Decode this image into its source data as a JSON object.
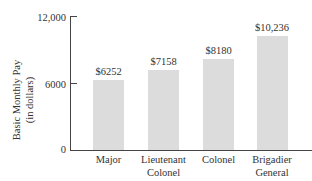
{
  "chart_data": {
    "type": "bar",
    "title": "",
    "xlabel": "",
    "ylabel": "Basic Monthly Pay (in dollars)",
    "ylabel_lines": [
      "Basic Monthly Pay",
      "(in dollars)"
    ],
    "categories": [
      "Major",
      "Lieutenant Colonel",
      "Colonel",
      "Brigadier General"
    ],
    "category_lines": [
      [
        "Major"
      ],
      [
        "Lieutenant",
        "Colonel"
      ],
      [
        "Colonel"
      ],
      [
        "Brigadier",
        "General"
      ]
    ],
    "values": [
      6252,
      7158,
      8180,
      10236
    ],
    "value_labels": [
      "$6252",
      "$7158",
      "$8180",
      "$10,236"
    ],
    "ylim": [
      0,
      12000
    ],
    "yticks": [
      0,
      6000,
      12000
    ],
    "ytick_labels": [
      "0",
      "6000",
      "12,000"
    ],
    "grid": false,
    "bar_color": "#dcdcdc"
  }
}
